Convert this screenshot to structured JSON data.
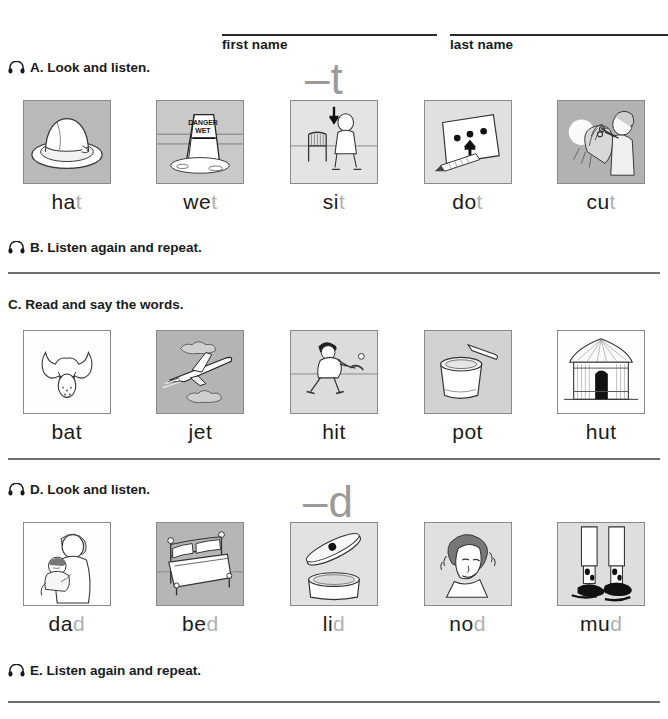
{
  "worksheet": {
    "name_fields": [
      {
        "label": "first name"
      },
      {
        "label": "last name"
      }
    ],
    "sections": [
      {
        "id": "A",
        "label": "A. Look and listen.",
        "icon": "headphones-icon",
        "has_icon": true,
        "phoneme": "–t",
        "items": [
          {
            "word_stem": "ha",
            "word_tail": "t",
            "word": "hat",
            "image": "fedora-hat",
            "bg": "gray"
          },
          {
            "word_stem": "we",
            "word_tail": "t",
            "word": "wet",
            "image": "danger-wet-sign",
            "bg": "lightgray"
          },
          {
            "word_stem": "si",
            "word_tail": "t",
            "word": "sit",
            "image": "person-sitting-chair",
            "bg": "lightgray"
          },
          {
            "word_stem": "do",
            "word_tail": "t",
            "word": "dot",
            "image": "paper-with-dots",
            "bg": "lightgray"
          },
          {
            "word_stem": "cu",
            "word_tail": "t",
            "word": "cut",
            "image": "haircut-scissors",
            "bg": "gray"
          }
        ]
      },
      {
        "id": "B",
        "label": "B. Listen again and repeat.",
        "icon": "headphones-icon",
        "has_icon": true
      },
      {
        "id": "C",
        "label": "C. Read and say the words.",
        "icon": null,
        "has_icon": false,
        "phoneme": null,
        "items": [
          {
            "word_stem": "bat",
            "word_tail": "",
            "word": "bat",
            "image": "flying-bat",
            "bg": "white"
          },
          {
            "word_stem": "jet",
            "word_tail": "",
            "word": "jet",
            "image": "jet-airplane",
            "bg": "gray"
          },
          {
            "word_stem": "hit",
            "word_tail": "",
            "word": "hit",
            "image": "baseball-batter",
            "bg": "lightgray"
          },
          {
            "word_stem": "pot",
            "word_tail": "",
            "word": "pot",
            "image": "cooking-pot",
            "bg": "lightgray"
          },
          {
            "word_stem": "hut",
            "word_tail": "",
            "word": "hut",
            "image": "thatched-hut",
            "bg": "white"
          }
        ]
      },
      {
        "id": "D",
        "label": "D. Look and listen.",
        "icon": "headphones-icon",
        "has_icon": true,
        "phoneme": "–d",
        "items": [
          {
            "word_stem": "da",
            "word_tail": "d",
            "word": "dad",
            "image": "father-holding-baby",
            "bg": "white"
          },
          {
            "word_stem": "be",
            "word_tail": "d",
            "word": "bed",
            "image": "bed",
            "bg": "gray"
          },
          {
            "word_stem": "li",
            "word_tail": "d",
            "word": "lid",
            "image": "pot-lid",
            "bg": "lightgray"
          },
          {
            "word_stem": "no",
            "word_tail": "d",
            "word": "nod",
            "image": "man-nodding-head",
            "bg": "lightgray"
          },
          {
            "word_stem": "mu",
            "word_tail": "d",
            "word": "mud",
            "image": "feet-in-mud",
            "bg": "lightgray"
          }
        ]
      },
      {
        "id": "E",
        "label": "E. Listen again and repeat.",
        "icon": "headphones-icon",
        "has_icon": true
      }
    ],
    "colors": {
      "text": "#1a1a1a",
      "faded_letter": "#b0b0b0",
      "phoneme": "#9a9a9a",
      "divider": "#6e6e6e",
      "frame": "#8a8a8a",
      "panel_gray": "#b9b9b9",
      "panel_light": "#dcdcdc"
    }
  }
}
